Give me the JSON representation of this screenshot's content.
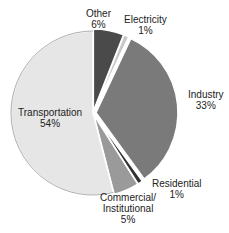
{
  "chart_data": {
    "type": "pie",
    "title": "",
    "categories": [
      "Other",
      "Electricity",
      "Industry",
      "Residential",
      "Commercial/ Institutional",
      "Transportation"
    ],
    "values": [
      6,
      1,
      33,
      1,
      5,
      54
    ],
    "labels": [
      {
        "name": "Other",
        "pct": "6%"
      },
      {
        "name": "Electricity",
        "pct": "1%"
      },
      {
        "name": "Industry",
        "pct": "33%"
      },
      {
        "name": "Residential",
        "pct": "1%"
      },
      {
        "name": "Commercial/",
        "name2": "Institutional",
        "pct": "5%"
      },
      {
        "name": "Transportation",
        "pct": "54%"
      }
    ],
    "colors": [
      "#4a4a4a",
      "#c8c8c8",
      "#7a7a7a",
      "#333333",
      "#9a9a9a",
      "#e6e6e6"
    ],
    "legend": "none"
  }
}
